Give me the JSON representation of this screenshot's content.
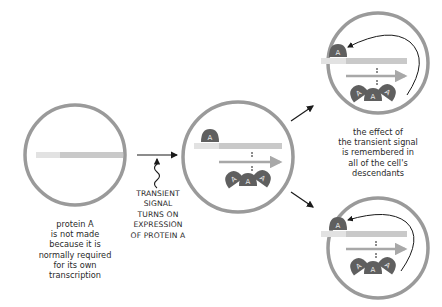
{
  "diagram": {
    "type": "cell-memory-positive-feedback",
    "colors": {
      "cell_membrane": "#9a9a9a",
      "gene_bar": "#c9c9c9",
      "gene_promoter": "#e2e2e2",
      "mrna_arrow": "#a8a8a8",
      "protein_fill": "#5f5f5f",
      "protein_label": "#e9e9e9",
      "arrows": "#1a1a1a",
      "text": "#2a2a2a"
    },
    "protein_letter": "A",
    "cells": [
      {
        "id": "initial",
        "state": "gene off"
      },
      {
        "id": "induced",
        "state": "gene on"
      },
      {
        "id": "descendant-top",
        "state": "gene on, self-sustaining"
      },
      {
        "id": "descendant-bottom",
        "state": "gene on, self-sustaining"
      }
    ]
  },
  "labels": {
    "left_caption": [
      "protein A",
      "is not made",
      "because it is",
      "normally required",
      "for its own",
      "transcription"
    ],
    "signal_caption": [
      "TRANSIENT",
      "SIGNAL",
      "TURNS ON",
      "EXPRESSION",
      "OF PROTEIN A"
    ],
    "right_caption": [
      "the effect of",
      "the transient signal",
      "is remembered in",
      "all of the cell's",
      "descendants"
    ]
  }
}
